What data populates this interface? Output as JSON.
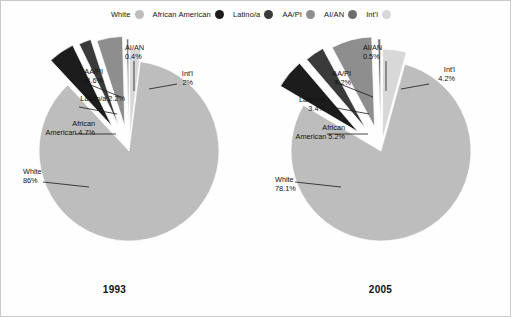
{
  "legend": {
    "items": [
      {
        "label": "White",
        "color": "#bdbdbd",
        "icon": "legend-dot"
      },
      {
        "label": "African American",
        "color": "#1c1c1c",
        "icon": "legend-dot"
      },
      {
        "label": "Latino/a",
        "color": "#3a3a3a",
        "icon": "legend-dot"
      },
      {
        "label": "AA/PI",
        "color": "#8e8e8e",
        "icon": "legend-dot"
      },
      {
        "label": "AI/AN",
        "color": "#6e6e6e",
        "icon": "legend-dot"
      },
      {
        "label": "Int'l",
        "color": "#d8d8d8",
        "icon": "legend-dot"
      }
    ]
  },
  "chart_data": {
    "type": "pie",
    "title": "",
    "categories": [
      "White",
      "African American",
      "Latino/a",
      "AA/PI",
      "AI/AN",
      "Int'l"
    ],
    "colors": [
      "#bdbdbd",
      "#1c1c1c",
      "#3a3a3a",
      "#8e8e8e",
      "#6e6e6e",
      "#d8d8d8"
    ],
    "legend_position": "top",
    "grid": false,
    "charts": [
      {
        "year": "1993",
        "values": [
          86,
          4.7,
          2.2,
          4.6,
          0.4,
          2
        ],
        "labels": [
          {
            "name": "White",
            "value": "86%",
            "line1": "White",
            "line2": "86%"
          },
          {
            "name": "African American",
            "value": "4.7%",
            "line1": "African",
            "line2": "American 4.7%"
          },
          {
            "name": "Latino/a",
            "value": "2.2%",
            "line1": "Latino/a  2.2%",
            "line2": ""
          },
          {
            "name": "AA/PI",
            "value": "4.6%",
            "line1": "AA/PI",
            "line2": "4.6%"
          },
          {
            "name": "AI/AN",
            "value": "0.4%",
            "line1": "AI/AN",
            "line2": "0.4%"
          },
          {
            "name": "Int'l",
            "value": "2%",
            "line1": "Int'l",
            "line2": "2%"
          }
        ]
      },
      {
        "year": "2005",
        "values": [
          78.1,
          5.2,
          3.4,
          7.2,
          0.5,
          4.2
        ],
        "labels": [
          {
            "name": "White",
            "value": "78.1%",
            "line1": "White",
            "line2": "78.1%"
          },
          {
            "name": "African American",
            "value": "5.2%",
            "line1": "African",
            "line2": "American 5.2%"
          },
          {
            "name": "Latino/a",
            "value": "3.4%",
            "line1": "Latino/a",
            "line2": "3.4%"
          },
          {
            "name": "AA/PI",
            "value": "7.2%",
            "line1": "AA/PI",
            "line2": "7.2%"
          },
          {
            "name": "AI/AN",
            "value": "0.5%",
            "line1": "AI/AN",
            "line2": "0.5%"
          },
          {
            "name": "Int'l",
            "value": "4.2%",
            "line1": "Int'l",
            "line2": "4.2%"
          }
        ]
      }
    ]
  }
}
